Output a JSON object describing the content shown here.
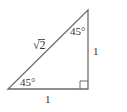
{
  "diagram": {
    "stroke_color": "#6b6b6b",
    "text_color": "#333333",
    "vertices": {
      "bottom_left": [
        8,
        89
      ],
      "right_angle": [
        88,
        89
      ],
      "top": [
        88,
        10
      ]
    },
    "labels": {
      "hypotenuse": "√2",
      "hyp_radical": "√",
      "hyp_radicand": "2",
      "top_angle": "45°",
      "bottom_left_angle": "45°",
      "vertical_leg": "1",
      "horizontal_leg": "1"
    }
  }
}
